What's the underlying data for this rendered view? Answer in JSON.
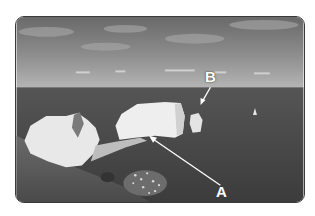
{
  "image": {
    "description": "Grayscale photograph of white chalk sea stacks off a grassy coastal headland, with calm sea and cloudy sky",
    "colors": {
      "sky_top": "#6e6e6e",
      "sky_horizon": "#b8b8b8",
      "sea": "#4a4a4a",
      "sea_dark": "#3a3a3a",
      "chalk": "#ededed",
      "grass": "#5a5a5a",
      "frame_border": "#3a3a3a",
      "annotation": "#ffffff"
    }
  },
  "annotations": [
    {
      "id": "A",
      "label": "A",
      "target": "wave-cut platform / arch base at foot of main stack"
    },
    {
      "id": "B",
      "label": "B",
      "target": "small detached sea stack"
    }
  ]
}
